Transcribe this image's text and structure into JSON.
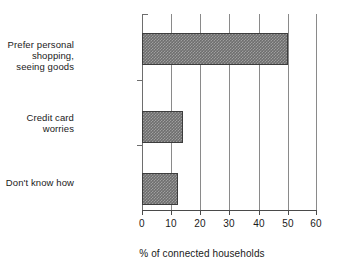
{
  "chart_data": {
    "type": "bar",
    "orientation": "horizontal",
    "title": "",
    "xlabel": "% of connected households",
    "ylabel": "",
    "categories": [
      "Prefer personal shopping,\nseeing goods",
      "Credit card worries",
      "Don't know how"
    ],
    "values": [
      50,
      14,
      12.5
    ],
    "xlim": [
      0,
      60
    ],
    "xticks": [
      0,
      10,
      20,
      30,
      40,
      50,
      60
    ],
    "xticklabels": [
      "0",
      "10",
      "20",
      "30",
      "40",
      "50",
      "60"
    ],
    "grid": "vertical",
    "legend": "none",
    "bar_fill_color": "#6e6e6e",
    "bar_edge_color": "#3d3d3d",
    "axis_color": "#4a4a4a",
    "gridline_color": "#8a8a8a",
    "background_color": "#ffffff",
    "text_color": "#1a1a1a"
  }
}
